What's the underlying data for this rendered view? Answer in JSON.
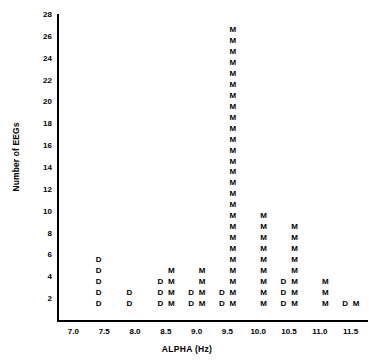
{
  "chart_data": {
    "type": "scatter",
    "title": "",
    "xlabel": "ALPHA (Hz)",
    "ylabel": "Number of EEGs",
    "xlim": [
      6.75,
      11.75
    ],
    "ylim": [
      0,
      28
    ],
    "grid": false,
    "legend_position": "none",
    "marker_labels": [
      "D",
      "M"
    ],
    "xticks": [
      "7.0",
      "7.5",
      "8.0",
      "8.5",
      "9.0",
      "9.5",
      "10.0",
      "10.5",
      "11.0",
      "11.5"
    ],
    "xtick_values": [
      7.0,
      7.5,
      8.0,
      8.5,
      9.0,
      9.5,
      10.0,
      10.5,
      11.0,
      11.5
    ],
    "yticks": [
      "2",
      "4",
      "6",
      "8",
      "10",
      "12",
      "14",
      "16",
      "18",
      "20",
      "22",
      "24",
      "26",
      "28"
    ],
    "ytick_values": [
      2,
      4,
      6,
      8,
      10,
      12,
      14,
      16,
      18,
      20,
      22,
      24,
      26,
      28
    ],
    "categories": [
      7.0,
      7.5,
      8.0,
      8.5,
      9.0,
      9.5,
      10.0,
      10.5,
      11.0,
      11.5
    ],
    "series": [
      {
        "name": "D",
        "label": "D",
        "values": [
          0,
          5,
          2,
          3,
          2,
          2,
          0,
          3,
          0,
          1
        ]
      },
      {
        "name": "M",
        "label": "M",
        "values": [
          0,
          0,
          0,
          4,
          4,
          26,
          9,
          8,
          3,
          1
        ]
      }
    ],
    "annotations": []
  }
}
